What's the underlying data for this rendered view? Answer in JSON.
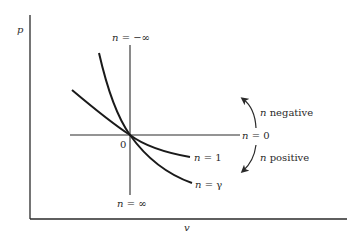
{
  "axes": {
    "y_label": "p",
    "x_label": "v"
  },
  "origin_label": "0",
  "curves": [
    {
      "id": "n1",
      "label_var": "n",
      "label_eq": " = 1"
    },
    {
      "id": "ngamma",
      "label_var": "n",
      "label_eq": " = γ"
    }
  ],
  "lines": {
    "vertical_top": {
      "label_var": "n",
      "label_eq": " = −∞"
    },
    "vertical_bottom": {
      "label_var": "n",
      "label_eq": " = ∞"
    },
    "horizontal": {
      "label_var": "n",
      "label_eq": " = 0"
    }
  },
  "arrows": {
    "up": {
      "label_var": "n",
      "label_text": " negative"
    },
    "down": {
      "label_var": "n",
      "label_text": " positive"
    }
  },
  "colors": {
    "ink": "#2a2a2a",
    "background": "#ffffff"
  }
}
